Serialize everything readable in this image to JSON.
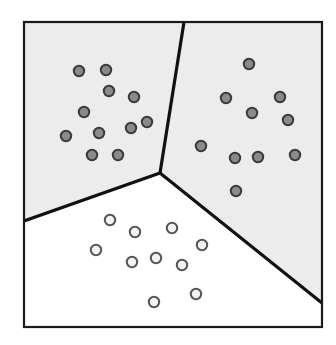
{
  "figure": {
    "title": "",
    "width": 336,
    "height": 345,
    "background_color": "#ffffff"
  },
  "frame": {
    "x": 24,
    "y": 22,
    "width": 298,
    "height": 305,
    "stroke_color": "#1a1a1a",
    "stroke_width": 2.2,
    "fill_color": "#ffffff"
  },
  "colors": {
    "region_shaded": "#ececec",
    "region_white": "#ffffff",
    "boundary_line": "#111111",
    "dark_point_fill": "#8a8a8a",
    "dark_point_stroke": "#3a3a3a",
    "light_point_fill": "#f2f2f2",
    "light_point_stroke": "#555555"
  },
  "chart_data": {
    "type": "scatter",
    "title": "",
    "subtitle": "",
    "xlabel": "",
    "ylabel": "",
    "xlim": [
      24,
      322
    ],
    "ylim": [
      22,
      327
    ],
    "grid": false,
    "legend_position": "none",
    "annotations": [],
    "regions": [
      {
        "name": "upper-left-region",
        "label": "Cluster A region",
        "fill": "#ececec",
        "polygon": "24,22 184,22 160,173 24,221"
      },
      {
        "name": "upper-right-region",
        "label": "Cluster B region",
        "fill": "#ececec",
        "polygon": "184,22 322,22 322,303 160,173"
      },
      {
        "name": "bottom-region",
        "label": "Cluster C region",
        "fill": "#ffffff",
        "polygon": "24,221 160,173 322,303 322,327 24,327"
      }
    ],
    "boundaries": [
      {
        "name": "boundary-top",
        "x1": 184,
        "y1": 22,
        "x2": 160,
        "y2": 173
      },
      {
        "name": "boundary-left",
        "x1": 160,
        "y1": 173,
        "x2": 24,
        "y2": 221
      },
      {
        "name": "boundary-right",
        "x1": 160,
        "y1": 173,
        "x2": 322,
        "y2": 303
      }
    ],
    "centroid_junction": {
      "x": 160,
      "y": 173
    },
    "series": [
      {
        "name": "Cluster A",
        "marker": "dark-circle",
        "fill": "#8a8a8a",
        "stroke": "#3a3a3a",
        "radius": 5.2,
        "count": 11,
        "points": [
          {
            "x": 79,
            "y": 71
          },
          {
            "x": 106,
            "y": 70
          },
          {
            "x": 109,
            "y": 91
          },
          {
            "x": 134,
            "y": 97
          },
          {
            "x": 84,
            "y": 112
          },
          {
            "x": 99,
            "y": 133
          },
          {
            "x": 131,
            "y": 128
          },
          {
            "x": 66,
            "y": 136
          },
          {
            "x": 92,
            "y": 155
          },
          {
            "x": 118,
            "y": 155
          },
          {
            "x": 147,
            "y": 122
          }
        ]
      },
      {
        "name": "Cluster B",
        "marker": "dark-circle",
        "fill": "#8a8a8a",
        "stroke": "#3a3a3a",
        "radius": 5.2,
        "count": 11,
        "points": [
          {
            "x": 249,
            "y": 64
          },
          {
            "x": 226,
            "y": 98
          },
          {
            "x": 280,
            "y": 97
          },
          {
            "x": 252,
            "y": 113
          },
          {
            "x": 288,
            "y": 120
          },
          {
            "x": 201,
            "y": 146
          },
          {
            "x": 235,
            "y": 158
          },
          {
            "x": 258,
            "y": 157
          },
          {
            "x": 295,
            "y": 155
          },
          {
            "x": 236,
            "y": 191
          }
        ]
      },
      {
        "name": "Cluster C",
        "marker": "light-circle",
        "fill": "#f2f2f2",
        "stroke": "#555555",
        "radius": 5.2,
        "count": 11,
        "points": [
          {
            "x": 110,
            "y": 220
          },
          {
            "x": 135,
            "y": 232
          },
          {
            "x": 172,
            "y": 228
          },
          {
            "x": 96,
            "y": 250
          },
          {
            "x": 202,
            "y": 245
          },
          {
            "x": 156,
            "y": 258
          },
          {
            "x": 132,
            "y": 262
          },
          {
            "x": 182,
            "y": 265
          },
          {
            "x": 196,
            "y": 294
          },
          {
            "x": 154,
            "y": 302
          }
        ]
      }
    ]
  }
}
